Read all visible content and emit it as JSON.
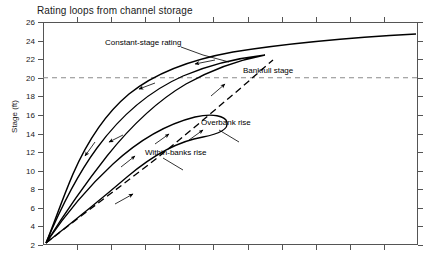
{
  "chart_data": {
    "type": "line",
    "title": "Rating loops from channel storage",
    "xlabel": "",
    "ylabel": "Stage (ft)",
    "ylim": [
      2,
      26
    ],
    "ytick_labels": [
      "2",
      "4",
      "6",
      "8",
      "10",
      "12",
      "14",
      "16",
      "18",
      "20",
      "22",
      "24",
      "26"
    ],
    "xlim": [
      0,
      10
    ],
    "xtick_labels": [],
    "grid": false,
    "legend": null,
    "reference_lines": [
      {
        "name": "bankfull-stage",
        "orientation": "horizontal",
        "value": 20,
        "style": "dashed",
        "color": "#8a8a8a"
      }
    ],
    "series": [
      {
        "name": "Constant-stage rating",
        "style": "solid",
        "description": "Steady-flow rating curve rising steeply from stage 2 and flattening toward stage 25",
        "points": [
          [
            0.05,
            2
          ],
          [
            0.3,
            6
          ],
          [
            0.7,
            11
          ],
          [
            1.2,
            15
          ],
          [
            1.9,
            18
          ],
          [
            2.8,
            20.4
          ],
          [
            4.0,
            22.0
          ],
          [
            5.5,
            23.2
          ],
          [
            7.0,
            24.0
          ],
          [
            8.5,
            24.6
          ],
          [
            10,
            25.0
          ]
        ]
      },
      {
        "name": "Overbank rise",
        "style": "solid",
        "description": "Large counterclockwise hysteresis loop crossing bankfull stage",
        "points": [
          [
            0.05,
            2
          ],
          [
            0.6,
            8
          ],
          [
            1.1,
            13
          ],
          [
            1.6,
            17
          ],
          [
            2.2,
            19.8
          ],
          [
            3.0,
            21.2
          ],
          [
            3.9,
            21.8
          ],
          [
            3.2,
            20.6
          ],
          [
            2.2,
            18.0
          ],
          [
            1.4,
            14.0
          ],
          [
            0.7,
            8.5
          ],
          [
            0.05,
            2
          ]
        ]
      },
      {
        "name": "Within-banks rise",
        "style": "solid",
        "description": "Smaller inner counterclockwise loop peaking near stage 17 below bankfull",
        "points": [
          [
            0.05,
            2
          ],
          [
            0.9,
            9
          ],
          [
            1.6,
            13.5
          ],
          [
            2.3,
            16.3
          ],
          [
            3.0,
            17.2
          ],
          [
            3.6,
            16.6
          ],
          [
            3.0,
            15.0
          ],
          [
            2.2,
            11.8
          ],
          [
            1.3,
            7.5
          ],
          [
            0.05,
            2
          ]
        ]
      },
      {
        "name": "Within-banks rise dashed limb",
        "style": "dashed",
        "description": "Dashed rising limb from origin up through the loops to the main curve",
        "points": [
          [
            0.05,
            2
          ],
          [
            1.0,
            7.0
          ],
          [
            2.0,
            12.0
          ],
          [
            2.9,
            16.0
          ],
          [
            3.6,
            19.0
          ],
          [
            4.1,
            20.8
          ],
          [
            4.6,
            21.9
          ]
        ]
      }
    ],
    "annotations": [
      {
        "name": "constant-stage-rating",
        "text": "Constant-stage rating"
      },
      {
        "name": "bankfull-stage",
        "text": "Bankfull stage"
      },
      {
        "name": "overbank-rise",
        "text": "Overbank rise"
      },
      {
        "name": "within-banks-rise",
        "text": "Within-banks rise"
      }
    ],
    "flow_direction_arrows": "counterclockwise loops; arrows point up on rising limbs and down-left on falling limbs"
  }
}
